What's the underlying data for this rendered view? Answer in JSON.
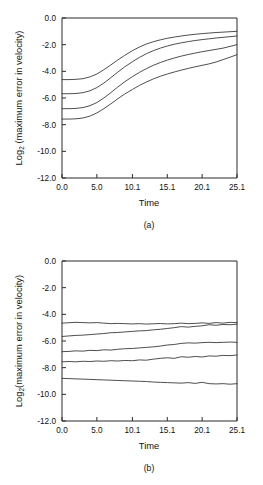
{
  "figure": {
    "panels": [
      {
        "caption": "(a)"
      },
      {
        "caption": "(b)"
      }
    ]
  },
  "chart_data": [
    {
      "type": "line",
      "panel_label": "(a)",
      "title": "",
      "xlabel": "Time",
      "ylabel": "Log2 (maximum error in velocity)",
      "ylabel_base": "Log",
      "ylabel_subscript": "2",
      "ylabel_rest": " (maximum error in velocity)",
      "xlim": [
        0.0,
        25.1
      ],
      "ylim": [
        -12.0,
        0.0
      ],
      "xticks": [
        0.0,
        5.0,
        10.1,
        15.1,
        20.1,
        25.1
      ],
      "xticklabels": [
        "0.0",
        "5.0",
        "10.1",
        "15.1",
        "20.1",
        "25.1"
      ],
      "yticks": [
        0.0,
        -2.0,
        -4.0,
        -6.0,
        -8.0,
        -10.0,
        -12.0
      ],
      "yticklabels": [
        "0.0",
        "-2.0",
        "-4.0",
        "-6.0",
        "-8.0",
        "-10.0",
        "-12.0"
      ],
      "grid": false,
      "legend": false,
      "line_color": "#3a3a3a",
      "x": [
        0.0,
        1.0,
        2.0,
        3.0,
        4.0,
        5.0,
        6.0,
        7.0,
        8.0,
        9.0,
        10.1,
        11.1,
        12.1,
        13.1,
        14.1,
        15.1,
        16.1,
        17.1,
        18.1,
        19.1,
        20.1,
        21.1,
        22.1,
        23.1,
        24.1,
        25.1
      ],
      "series": [
        {
          "name": "curve-1",
          "values": [
            -4.62,
            -4.62,
            -4.6,
            -4.55,
            -4.42,
            -4.2,
            -3.88,
            -3.52,
            -3.15,
            -2.8,
            -2.45,
            -2.18,
            -1.95,
            -1.78,
            -1.64,
            -1.52,
            -1.43,
            -1.35,
            -1.28,
            -1.22,
            -1.17,
            -1.13,
            -1.09,
            -1.06,
            -1.03,
            -1.0
          ]
        },
        {
          "name": "curve-2",
          "values": [
            -5.68,
            -5.68,
            -5.66,
            -5.6,
            -5.46,
            -5.22,
            -4.88,
            -4.48,
            -4.06,
            -3.66,
            -3.28,
            -2.96,
            -2.68,
            -2.45,
            -2.26,
            -2.1,
            -1.97,
            -1.86,
            -1.77,
            -1.69,
            -1.62,
            -1.56,
            -1.5,
            -1.45,
            -1.4,
            -1.35
          ]
        },
        {
          "name": "curve-3",
          "values": [
            -6.8,
            -6.8,
            -6.78,
            -6.72,
            -6.58,
            -6.34,
            -6.0,
            -5.6,
            -5.18,
            -4.78,
            -4.4,
            -4.08,
            -3.8,
            -3.55,
            -3.34,
            -3.16,
            -3.0,
            -2.86,
            -2.74,
            -2.63,
            -2.53,
            -2.44,
            -2.35,
            -2.26,
            -2.13,
            -2.0
          ]
        },
        {
          "name": "curve-4",
          "values": [
            -7.58,
            -7.58,
            -7.56,
            -7.5,
            -7.36,
            -7.12,
            -6.8,
            -6.44,
            -6.06,
            -5.7,
            -5.36,
            -5.06,
            -4.8,
            -4.57,
            -4.37,
            -4.2,
            -4.05,
            -3.91,
            -3.78,
            -3.66,
            -3.55,
            -3.44,
            -3.3,
            -3.12,
            -2.94,
            -2.75
          ]
        }
      ]
    },
    {
      "type": "line",
      "panel_label": "(b)",
      "title": "",
      "xlabel": "Time",
      "ylabel": "Log2(maximum error in velocity)",
      "ylabel_base": "Log",
      "ylabel_subscript": "2",
      "ylabel_rest": "(maximum error in velocity)",
      "xlim": [
        0.0,
        25.1
      ],
      "ylim": [
        -12.0,
        0.0
      ],
      "xticks": [
        0.0,
        5.0,
        10.1,
        15.1,
        20.1,
        25.1
      ],
      "xticklabels": [
        "0.0",
        "5.0",
        "10.1",
        "15.1",
        "20.1",
        "25.1"
      ],
      "yticks": [
        0.0,
        -2.0,
        -4.0,
        -6.0,
        -8.0,
        -10.0,
        -12.0
      ],
      "yticklabels": [
        "0.0",
        "-2.0",
        "-4.0",
        "-6.0",
        "-8.0",
        "-10.0",
        "-12.0"
      ],
      "grid": false,
      "legend": false,
      "line_color": "#3a3a3a",
      "x": [
        0.0,
        1.0,
        2.0,
        3.0,
        4.0,
        5.0,
        6.0,
        7.0,
        8.0,
        9.0,
        10.1,
        11.1,
        12.1,
        13.1,
        14.1,
        15.1,
        16.1,
        17.1,
        18.1,
        19.1,
        20.1,
        21.1,
        22.1,
        23.1,
        24.1,
        25.1
      ],
      "series": [
        {
          "name": "curve-1",
          "values": [
            -4.66,
            -4.63,
            -4.6,
            -4.62,
            -4.64,
            -4.62,
            -4.66,
            -4.7,
            -4.68,
            -4.7,
            -4.72,
            -4.7,
            -4.73,
            -4.71,
            -4.69,
            -4.72,
            -4.7,
            -4.66,
            -4.7,
            -4.68,
            -4.64,
            -4.68,
            -4.62,
            -4.66,
            -4.6,
            -4.62
          ]
        },
        {
          "name": "curve-2",
          "values": [
            -5.66,
            -5.62,
            -5.58,
            -5.56,
            -5.52,
            -5.48,
            -5.44,
            -5.38,
            -5.36,
            -5.32,
            -5.28,
            -5.24,
            -5.22,
            -5.16,
            -5.12,
            -5.06,
            -5.0,
            -4.92,
            -4.96,
            -4.9,
            -4.86,
            -4.78,
            -4.82,
            -4.76,
            -4.78,
            -4.74
          ]
        },
        {
          "name": "curve-3",
          "values": [
            -6.8,
            -6.78,
            -6.74,
            -6.76,
            -6.7,
            -6.72,
            -6.66,
            -6.68,
            -6.62,
            -6.58,
            -6.56,
            -6.52,
            -6.48,
            -6.44,
            -6.38,
            -6.3,
            -6.26,
            -6.18,
            -6.14,
            -6.16,
            -6.12,
            -6.1,
            -6.12,
            -6.1,
            -6.08,
            -6.1
          ]
        },
        {
          "name": "curve-4",
          "values": [
            -7.56,
            -7.54,
            -7.56,
            -7.52,
            -7.54,
            -7.5,
            -7.52,
            -7.48,
            -7.5,
            -7.46,
            -7.48,
            -7.42,
            -7.44,
            -7.36,
            -7.3,
            -7.26,
            -7.3,
            -7.18,
            -7.22,
            -7.16,
            -7.2,
            -7.12,
            -7.14,
            -7.08,
            -7.1,
            -7.05
          ]
        },
        {
          "name": "curve-5",
          "values": [
            -8.8,
            -8.82,
            -8.84,
            -8.86,
            -8.88,
            -8.9,
            -8.92,
            -8.94,
            -8.96,
            -8.98,
            -9.0,
            -9.02,
            -9.04,
            -9.08,
            -9.1,
            -9.12,
            -9.14,
            -9.16,
            -9.12,
            -9.18,
            -9.1,
            -9.2,
            -9.22,
            -9.2,
            -9.24,
            -9.2
          ]
        }
      ]
    }
  ]
}
